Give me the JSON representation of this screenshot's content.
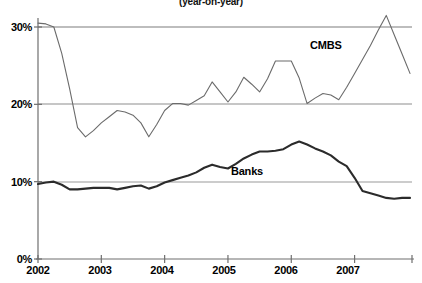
{
  "chart_data": {
    "type": "line",
    "title": "(year-on-year)",
    "xlabel": "",
    "ylabel": "",
    "xlim": [
      2002.0,
      2007.875
    ],
    "ylim": [
      0,
      33
    ],
    "grid": "horizontal",
    "legend_position": "inline-annotation",
    "y_ticks": [
      "0%",
      "10%",
      "20%",
      "30%"
    ],
    "y_tick_values": [
      0,
      10,
      20,
      30
    ],
    "x_ticks": [
      "2002",
      "2003",
      "2004",
      "2005",
      "2006",
      "2007"
    ],
    "x_tick_values": [
      2002,
      2003,
      2004,
      2005,
      2006,
      2007
    ],
    "x": [
      2002.0,
      2002.125,
      2002.25,
      2002.375,
      2002.5,
      2002.625,
      2002.75,
      2002.875,
      2003.0,
      2003.125,
      2003.25,
      2003.375,
      2003.5,
      2003.625,
      2003.75,
      2003.875,
      2004.0,
      2004.125,
      2004.25,
      2004.375,
      2004.5,
      2004.625,
      2004.75,
      2004.875,
      2005.0,
      2005.125,
      2005.25,
      2005.375,
      2005.5,
      2005.625,
      2005.75,
      2005.875,
      2006.0,
      2006.125,
      2006.25,
      2006.375,
      2006.5,
      2006.625,
      2006.75,
      2006.875,
      2007.0,
      2007.125,
      2007.25,
      2007.375,
      2007.5,
      2007.625,
      2007.75,
      2007.875
    ],
    "series": [
      {
        "name": "CMBS",
        "color": "#6b6b6b",
        "width": 1.1,
        "label_x": 2006.55,
        "label_y": 27.6,
        "values": [
          30.5,
          30.4,
          30.0,
          26.6,
          22.0,
          17.0,
          15.8,
          16.6,
          17.6,
          18.4,
          19.2,
          19.0,
          18.6,
          17.6,
          15.8,
          17.4,
          19.2,
          20.1,
          20.1,
          19.9,
          20.5,
          21.1,
          22.9,
          21.6,
          20.3,
          21.6,
          23.5,
          22.6,
          21.6,
          23.3,
          25.6,
          25.6,
          25.6,
          23.4,
          20.1,
          20.8,
          21.4,
          21.2,
          20.6,
          22.2,
          24.0,
          25.8,
          27.6,
          29.6,
          31.5,
          29.0,
          26.5,
          24.0
        ]
      },
      {
        "name": "Banks",
        "color": "#2b2b2b",
        "width": 2.1,
        "label_x": 2005.3,
        "label_y": 11.2,
        "values": [
          9.7,
          9.9,
          10.0,
          9.6,
          9.0,
          9.0,
          9.1,
          9.2,
          9.2,
          9.2,
          9.0,
          9.2,
          9.4,
          9.5,
          9.1,
          9.4,
          9.9,
          10.2,
          10.5,
          10.8,
          11.2,
          11.8,
          12.2,
          11.9,
          11.7,
          12.3,
          13.0,
          13.5,
          13.9,
          13.9,
          14.0,
          14.2,
          14.8,
          15.2,
          14.8,
          14.3,
          13.9,
          13.4,
          12.6,
          12.0,
          10.5,
          8.8,
          8.5,
          8.2,
          7.9,
          7.8,
          7.9,
          7.9
        ]
      }
    ]
  },
  "axis": {
    "y_labels": [
      "30%",
      "20%",
      "10%",
      "0%"
    ],
    "x_labels": [
      "2002",
      "2003",
      "2004",
      "2005",
      "2006",
      "2007"
    ]
  },
  "annotations": {
    "cmbs_label": "CMBS",
    "banks_label": "Banks"
  },
  "header": {
    "title": "(year-on-year)"
  },
  "colors": {
    "cmbs": "#6b6b6b",
    "banks": "#2b2b2b",
    "gridline": "#8a8a8a",
    "axis": "#6f6f6f",
    "background": "#ffffff"
  }
}
